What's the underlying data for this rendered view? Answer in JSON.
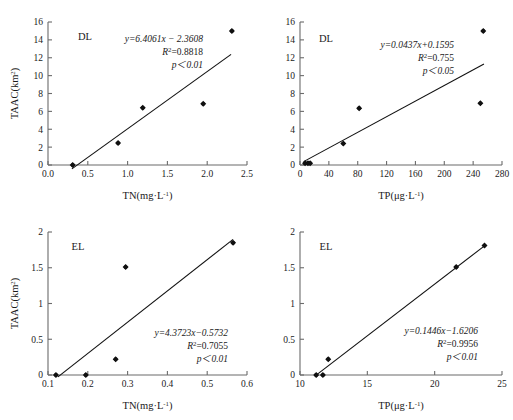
{
  "figure": {
    "background": "#ffffff",
    "marker_color": "#101010",
    "line_color": "#101010",
    "axis_color": "#6b6b6b"
  },
  "chart_data": [
    {
      "type": "scatter",
      "panel": "top-left",
      "title": "",
      "group_label": "DL",
      "xlabel": "TN(mg·L",
      "xlabel_sup": "-1",
      "xlabel_tail": ")",
      "ylabel": "TAAC(km",
      "ylabel_sup": "2",
      "ylabel_tail": ")",
      "xlim": [
        0.0,
        2.5
      ],
      "ylim": [
        0,
        16
      ],
      "xticks": [
        "0.0",
        "0.5",
        "1.0",
        "1.5",
        "2.0",
        "2.5"
      ],
      "xtick_values": [
        0.0,
        0.5,
        1.0,
        1.5,
        2.0,
        2.5
      ],
      "yticks": [
        "0",
        "2",
        "4",
        "6",
        "8",
        "10",
        "12",
        "14",
        "16"
      ],
      "ytick_values": [
        0,
        2,
        4,
        6,
        8,
        10,
        12,
        14,
        16
      ],
      "grid": false,
      "legend": "none",
      "x": [
        0.31,
        0.88,
        1.19,
        1.95,
        2.31
      ],
      "y": [
        0.0,
        2.45,
        6.4,
        6.85,
        15.0
      ],
      "fit": {
        "slope": 6.4061,
        "intercept": -2.3608,
        "x_start": 0.3,
        "x_end": 2.3,
        "equation": "y=6.4061x − 2.3608",
        "r2_prefix": "R",
        "r2_sup": "2",
        "r2_value": "=0.8818",
        "p_value": "p＜0.01"
      }
    },
    {
      "type": "scatter",
      "panel": "top-right",
      "title": "",
      "group_label": "DL",
      "xlabel": "TP(μg·L",
      "xlabel_sup": "-1",
      "xlabel_tail": ")",
      "ylabel": "",
      "ylabel_sup": "",
      "ylabel_tail": "",
      "xlim": [
        0,
        280
      ],
      "ylim": [
        0,
        16
      ],
      "xticks": [
        "0",
        "40",
        "80",
        "120",
        "160",
        "200",
        "240",
        "280"
      ],
      "xtick_values": [
        0,
        40,
        80,
        120,
        160,
        200,
        240,
        280
      ],
      "yticks": [
        "0",
        "2",
        "4",
        "6",
        "8",
        "10",
        "12",
        "14",
        "16"
      ],
      "ytick_values": [
        0,
        2,
        4,
        6,
        8,
        10,
        12,
        14,
        16
      ],
      "grid": false,
      "legend": "none",
      "x": [
        7,
        11,
        14,
        60,
        82,
        250,
        254
      ],
      "y": [
        0.2,
        0.2,
        0.2,
        2.4,
        6.35,
        6.9,
        15.0
      ],
      "fit": {
        "slope": 0.0437,
        "intercept": 0.1595,
        "x_start": 5,
        "x_end": 255,
        "equation": "y=0.0437x+0.1595",
        "r2_prefix": "R",
        "r2_sup": "2",
        "r2_value": "=0.755",
        "p_value": "p＜0.05"
      }
    },
    {
      "type": "scatter",
      "panel": "bottom-left",
      "title": "",
      "group_label": "EL",
      "xlabel": "TN(mg·L",
      "xlabel_sup": "-1",
      "xlabel_tail": ")",
      "ylabel": "TAAC(km",
      "ylabel_sup": "2",
      "ylabel_tail": ")",
      "xlim": [
        0.1,
        0.6
      ],
      "ylim": [
        0,
        2
      ],
      "xticks": [
        "0.1",
        "0.2",
        "0.3",
        "0.4",
        "0.5",
        "0.6"
      ],
      "xtick_values": [
        0.1,
        0.2,
        0.3,
        0.4,
        0.5,
        0.6
      ],
      "yticks": [
        "0",
        "0.5",
        "1",
        "1.5",
        "2"
      ],
      "ytick_values": [
        0,
        0.5,
        1,
        1.5,
        2
      ],
      "grid": false,
      "legend": "none",
      "x": [
        0.12,
        0.195,
        0.27,
        0.295,
        0.565
      ],
      "y": [
        0.0,
        0.0,
        0.22,
        1.51,
        1.85
      ],
      "fit": {
        "slope": 4.3723,
        "intercept": -0.5732,
        "x_start": 0.125,
        "x_end": 0.565,
        "equation": "y=4.3723x−0.5732",
        "r2_prefix": "R",
        "r2_sup": "2",
        "r2_value": "=0.7055",
        "p_value": "p＜0.01"
      }
    },
    {
      "type": "scatter",
      "panel": "bottom-right",
      "title": "",
      "group_label": "EL",
      "xlabel": "TP(μg·L",
      "xlabel_sup": "-1",
      "xlabel_tail": ")",
      "ylabel": "",
      "ylabel_sup": "",
      "ylabel_tail": "",
      "xlim": [
        10,
        25
      ],
      "ylim": [
        0,
        2
      ],
      "xticks": [
        "10",
        "15",
        "20",
        "25"
      ],
      "xtick_values": [
        10,
        15,
        20,
        25
      ],
      "yticks": [
        "0",
        "0.5",
        "1",
        "1.5",
        "2"
      ],
      "ytick_values": [
        0,
        0.5,
        1,
        1.5,
        2
      ],
      "grid": false,
      "legend": "none",
      "x": [
        11.2,
        11.7,
        12.1,
        21.6,
        23.7
      ],
      "y": [
        0.0,
        0.0,
        0.22,
        1.51,
        1.81
      ],
      "fit": {
        "slope": 0.1446,
        "intercept": -1.6206,
        "x_start": 11.2,
        "x_end": 23.7,
        "equation": "y=0.1446x−1.6206",
        "r2_prefix": "R",
        "r2_sup": "2",
        "r2_value": "=0.9956",
        "p_value": "p＜0.01"
      }
    }
  ]
}
